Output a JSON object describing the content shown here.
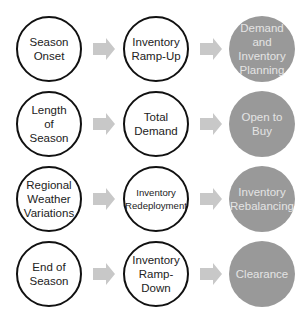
{
  "colors": {
    "outline_stroke": "#111111",
    "filled_circle": "#999999",
    "filled_text": "#e4e4e4",
    "arrow": "#c8c8c8"
  },
  "rows": [
    {
      "cause": "Season\nOnset",
      "effect": "Inventory\nRamp-Up",
      "outcome": "Demand\nand\nInventory\nPlanning"
    },
    {
      "cause": "Length\nof\nSeason",
      "effect": "Total\nDemand",
      "outcome": "Open to\nBuy"
    },
    {
      "cause": "Regional\nWeather\nVariations",
      "effect": "Inventory\nRedeployment",
      "outcome": "Inventory\nRebalancing"
    },
    {
      "cause": "End of\nSeason",
      "effect": "Inventory\nRamp-Down",
      "outcome": "Clearance"
    }
  ]
}
